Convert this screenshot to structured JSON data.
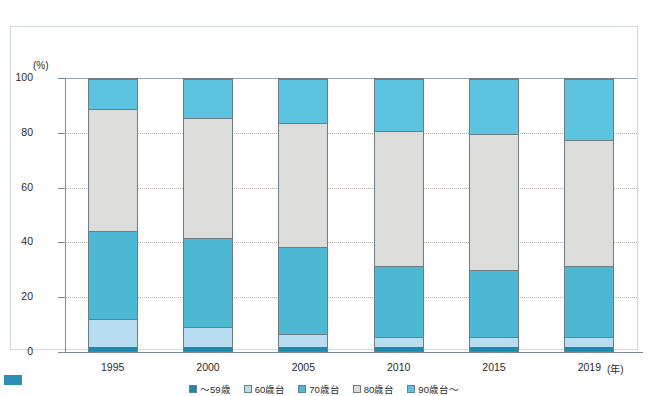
{
  "chart_data": {
    "type": "bar",
    "stacked": true,
    "title": "",
    "xlabel": "(年)",
    "ylabel": "(%)",
    "ylim": [
      0,
      100
    ],
    "yticks": [
      0,
      20,
      40,
      60,
      80,
      100
    ],
    "grid": true,
    "legend_position": "bottom",
    "categories": [
      "1995",
      "2000",
      "2005",
      "2010",
      "2015",
      "2019"
    ],
    "series": [
      {
        "name": "～59歳",
        "color": "#1b8ab0",
        "values": [
          1.5,
          1.5,
          1.5,
          1.5,
          1.5,
          1.5
        ]
      },
      {
        "name": "60歳台",
        "color": "#b9ddf0",
        "values": [
          10.0,
          7.0,
          4.5,
          3.5,
          3.5,
          3.5
        ]
      },
      {
        "name": "70歳台",
        "color": "#4cb8d4",
        "values": [
          32.5,
          33.0,
          32.0,
          26.0,
          24.5,
          26.0
        ]
      },
      {
        "name": "80歳台",
        "color": "#dcdcda",
        "values": [
          45.0,
          44.5,
          46.0,
          50.0,
          50.5,
          46.5
        ]
      },
      {
        "name": "90歳台～",
        "color": "#5cc3e0",
        "values": [
          11.0,
          14.0,
          16.0,
          19.0,
          20.0,
          22.5
        ]
      }
    ]
  },
  "axes": {
    "y_unit": "(%)",
    "x_unit": "(年)"
  },
  "colors": {
    "frame": "#cfd9de",
    "axis": "#7a8a93",
    "grid": "#b9b0ae",
    "bar_border": "#6f7d85",
    "corner_mark": "#2d8fb5"
  }
}
